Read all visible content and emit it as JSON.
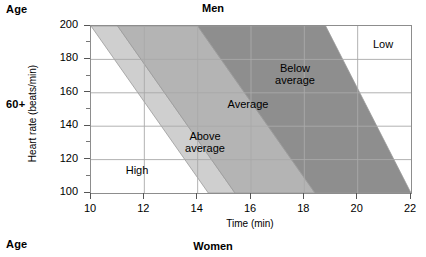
{
  "labels": {
    "age_top": "Age",
    "age_middle": "60+",
    "age_bottom": "Age",
    "title_men": "Men",
    "title_women": "Women"
  },
  "chart_data": {
    "type": "area",
    "title": "Men",
    "xlabel": "Time (min)",
    "ylabel": "Heart rate (beats/min)",
    "xlim": [
      10,
      22
    ],
    "ylim": [
      100,
      200
    ],
    "xticks": [
      10,
      12,
      14,
      16,
      18,
      20,
      22
    ],
    "yticks": [
      200,
      180,
      160,
      140,
      120,
      100
    ],
    "xminorticks": [
      11,
      13,
      15,
      17,
      19,
      21
    ],
    "yminorticks": [
      190,
      170,
      150,
      130,
      110
    ],
    "grid": true,
    "legend": "in-plot band labels",
    "bands": [
      {
        "name": "High",
        "label": "High",
        "color": "#ffffff",
        "label_x": 137,
        "label_y": 170,
        "top_x_start": 10.0,
        "top_x_end": 10.0,
        "bottom_x_start": 10.0,
        "bottom_x_end": 14.4
      },
      {
        "name": "Above average",
        "label": "Above\naverage",
        "color": "#cfcfcf",
        "label_x": 205,
        "label_y": 136,
        "top_x_start": 10.0,
        "top_x_end": 11.0,
        "bottom_x_start": 14.4,
        "bottom_x_end": 15.4
      },
      {
        "name": "Average",
        "label": "Average",
        "color": "#b4b4b4",
        "label_x": 248,
        "label_y": 104,
        "top_x_start": 11.0,
        "top_x_end": 14.0,
        "bottom_x_start": 15.4,
        "bottom_x_end": 18.4
      },
      {
        "name": "Below average",
        "label": "Below\naverage",
        "color": "#8e8e8e",
        "label_x": 295,
        "label_y": 68,
        "top_x_start": 14.0,
        "top_x_end": 18.8,
        "bottom_x_start": 18.4,
        "bottom_x_end": 22.0
      },
      {
        "name": "Low",
        "label": "Low",
        "color": "#ffffff",
        "label_x": 383,
        "label_y": 44,
        "top_x_start": 18.8,
        "top_x_end": 22.0,
        "bottom_x_start": 22.0,
        "bottom_x_end": 22.0
      }
    ],
    "colors": {
      "grid": "#a9a9a9",
      "frame": "#8d8d8d",
      "band_edge": "#9a9a9a",
      "text": "#000000"
    }
  }
}
